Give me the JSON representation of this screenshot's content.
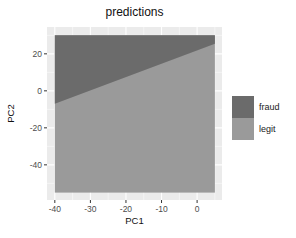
{
  "chart_data": {
    "type": "heatmap",
    "subtype": "decision-region",
    "title": "predictions",
    "xlabel": "PC1",
    "ylabel": "PC2",
    "xlim": [
      -42.2,
      7
    ],
    "ylim": [
      -59,
      34.5
    ],
    "fill_extent": {
      "x": [
        -40,
        5
      ],
      "y": [
        -55,
        30
      ]
    },
    "x_ticks": [
      -40,
      -30,
      -20,
      -10,
      0
    ],
    "y_ticks": [
      20,
      0,
      -20,
      -40
    ],
    "grid": true,
    "legend_position": "right",
    "boundary": {
      "points": [
        [
          -40,
          -7
        ],
        [
          5,
          25.5
        ]
      ]
    },
    "regions": [
      {
        "class": "fraud",
        "area": "above boundary",
        "color": "#6b6b6b"
      },
      {
        "class": "legit",
        "area": "below boundary",
        "color": "#9a9a9a"
      }
    ],
    "series": [
      {
        "name": "fraud",
        "color": "#6b6b6b"
      },
      {
        "name": "legit",
        "color": "#9a9a9a"
      }
    ]
  },
  "legend": {
    "items": [
      {
        "label": "fraud",
        "color": "#6b6b6b"
      },
      {
        "label": "legit",
        "color": "#9a9a9a"
      }
    ]
  }
}
